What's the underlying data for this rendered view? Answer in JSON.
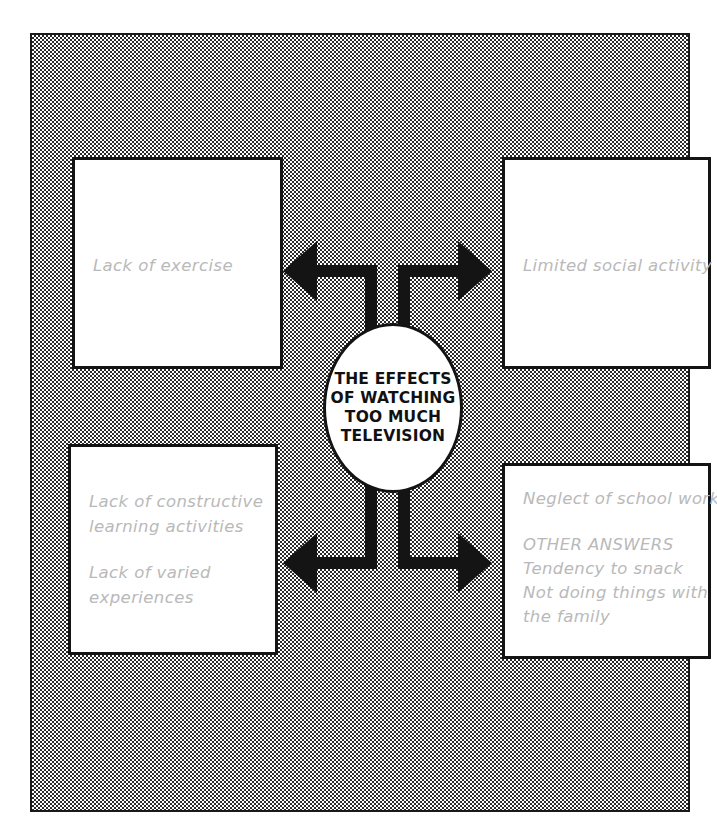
{
  "diagram": {
    "type": "spider-web-concept-map",
    "center": {
      "label": "THE EFFECTS\nOF WATCHING\nTOO MUCH\nTELEVISION"
    },
    "colors": {
      "ink": "#141414",
      "handwriting": "#b9b9b9",
      "panel_background": "#808080",
      "box_fill": "#ffffff"
    },
    "branches": [
      {
        "position": "top-left",
        "arrow_direction": "left",
        "lines": [
          {
            "text": "Lack of exercise",
            "style": "handwritten",
            "spaced": false
          }
        ]
      },
      {
        "position": "top-right",
        "arrow_direction": "right",
        "lines": [
          {
            "text": "Limited social activity",
            "style": "handwritten",
            "spaced": false
          }
        ]
      },
      {
        "position": "bottom-left",
        "arrow_direction": "left",
        "lines": [
          {
            "text": "Lack of constructive",
            "style": "handwritten",
            "spaced": false
          },
          {
            "text": "learning activities",
            "style": "handwritten",
            "spaced": false
          },
          {
            "text": "Lack of varied",
            "style": "handwritten",
            "spaced": true
          },
          {
            "text": "experiences",
            "style": "handwritten",
            "spaced": false
          }
        ]
      },
      {
        "position": "bottom-right",
        "arrow_direction": "right",
        "lines": [
          {
            "text": "Neglect of school work",
            "style": "handwritten",
            "spaced": false
          },
          {
            "text": "OTHER ANSWERS",
            "style": "handwritten-caps",
            "spaced": true
          },
          {
            "text": "Tendency to snack",
            "style": "handwritten",
            "spaced": false
          },
          {
            "text": "Not doing things with",
            "style": "handwritten",
            "spaced": false
          },
          {
            "text": "the family",
            "style": "handwritten",
            "spaced": false
          }
        ]
      }
    ]
  }
}
